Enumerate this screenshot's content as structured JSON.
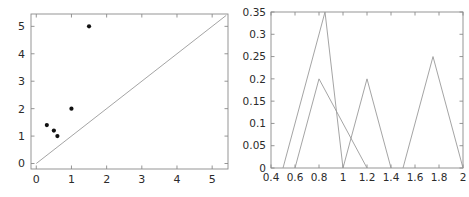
{
  "figure": {
    "panel_count": 2,
    "background": "#ffffff",
    "axis_color": "#8a8a8a",
    "marker_color": "#111111",
    "line_color": "#9a9a9a",
    "text_color": "#2b2b2b"
  },
  "chart_data": [
    {
      "type": "scatter",
      "title": "",
      "xlabel": "",
      "ylabel": "",
      "xlim": [
        -0.15,
        5.45
      ],
      "ylim": [
        -0.2,
        5.45
      ],
      "xticks": [
        0,
        1,
        2,
        3,
        4,
        5
      ],
      "xticklabels": [
        "0",
        "1",
        "2",
        "3",
        "4",
        "5"
      ],
      "yticks": [
        0,
        1,
        2,
        3,
        4,
        5
      ],
      "yticklabels": [
        "0",
        "1",
        "2",
        "3",
        "4",
        "5"
      ],
      "grid": false,
      "legend": "none",
      "series": [
        {
          "name": "data points",
          "marker": "filled-circle",
          "color": "#111111",
          "points": [
            {
              "x": 0.3,
              "y": 1.4
            },
            {
              "x": 0.5,
              "y": 1.2
            },
            {
              "x": 0.6,
              "y": 1.0
            },
            {
              "x": 1.0,
              "y": 2.0
            },
            {
              "x": 1.5,
              "y": 5.0
            }
          ]
        },
        {
          "name": "identity reference line",
          "marker": "none",
          "color": "#9a9a9a",
          "points": [
            {
              "x": 0.0,
              "y": 0.0
            },
            {
              "x": 5.4,
              "y": 5.4
            }
          ]
        }
      ]
    },
    {
      "type": "line",
      "title": "",
      "xlabel": "",
      "ylabel": "",
      "xlim": [
        0.4,
        2.0
      ],
      "ylim": [
        0,
        0.35
      ],
      "xticks": [
        0.4,
        0.6,
        0.8,
        1.0,
        1.2,
        1.4,
        1.6,
        1.8,
        2.0
      ],
      "xticklabels": [
        "0.4",
        "0.6",
        "0.8",
        "1",
        "1.2",
        "1.4",
        "1.6",
        "1.8",
        "2"
      ],
      "yticks": [
        0,
        0.05,
        0.1,
        0.15,
        0.2,
        0.25,
        0.3,
        0.35
      ],
      "yticklabels": [
        "0",
        "0.05",
        "0.1",
        "0.15",
        "0.2",
        "0.25",
        "0.3",
        "0.35"
      ],
      "grid": false,
      "legend": "none",
      "series": [
        {
          "name": "triangle-1",
          "color": "#9a9a9a",
          "points": [
            {
              "x": 0.5,
              "y": 0.0
            },
            {
              "x": 0.85,
              "y": 0.35
            },
            {
              "x": 1.0,
              "y": 0.0
            }
          ]
        },
        {
          "name": "triangle-2",
          "color": "#9a9a9a",
          "points": [
            {
              "x": 0.6,
              "y": 0.0
            },
            {
              "x": 0.8,
              "y": 0.2
            },
            {
              "x": 1.2,
              "y": 0.0
            }
          ]
        },
        {
          "name": "triangle-3",
          "color": "#9a9a9a",
          "points": [
            {
              "x": 1.0,
              "y": 0.0
            },
            {
              "x": 1.2,
              "y": 0.2
            },
            {
              "x": 1.4,
              "y": 0.0
            }
          ]
        },
        {
          "name": "triangle-4",
          "color": "#9a9a9a",
          "points": [
            {
              "x": 1.5,
              "y": 0.0
            },
            {
              "x": 1.75,
              "y": 0.25
            },
            {
              "x": 2.0,
              "y": 0.0
            }
          ]
        }
      ]
    }
  ]
}
